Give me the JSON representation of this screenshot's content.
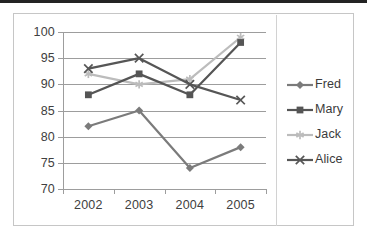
{
  "chart_data": {
    "type": "line",
    "title": "",
    "xlabel": "",
    "ylabel": "",
    "categories": [
      "2002",
      "2003",
      "2004",
      "2005"
    ],
    "x_tick_labels": [
      "2002",
      "2003",
      "2004",
      "2005"
    ],
    "y_tick_labels": [
      "100",
      "95",
      "90",
      "85",
      "80",
      "75",
      "70"
    ],
    "ylim": [
      70,
      100
    ],
    "y_tick_step": 5,
    "grid": true,
    "legend_position": "right",
    "series": [
      {
        "name": "Fred",
        "values": [
          82,
          85,
          74,
          78
        ],
        "color": "#7b7b7b",
        "marker": "diamond"
      },
      {
        "name": "Mary",
        "values": [
          88,
          92,
          88,
          98
        ],
        "color": "#555555",
        "marker": "square"
      },
      {
        "name": "Jack",
        "values": [
          92,
          90,
          91,
          99
        ],
        "color": "#bcbcbc",
        "marker": "asterisk"
      },
      {
        "name": "Alice",
        "values": [
          93,
          95,
          90,
          87
        ],
        "color": "#565656",
        "marker": "x"
      }
    ]
  },
  "legend": {
    "items": [
      {
        "label": "Fred"
      },
      {
        "label": "Mary"
      },
      {
        "label": "Jack"
      },
      {
        "label": "Alice"
      }
    ]
  },
  "colors": {
    "gridline": "#9d9d9d",
    "axis": "#9d9d9d",
    "frame_border": "#c6c6c6",
    "tick_text": "#404040",
    "legend_text": "#3b3b3b",
    "legend_divider": "#d2d2d2",
    "top_edge": "#232323",
    "background": "#ffffff"
  }
}
